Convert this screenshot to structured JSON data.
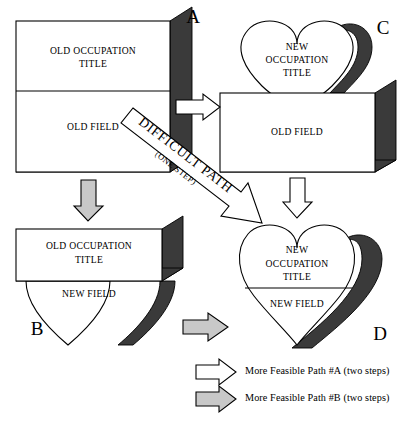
{
  "diagram": {
    "colors": {
      "shape_fill": "#ffffff",
      "shadow": "#3a3a3a",
      "arrow_feasible_a": "#ffffff",
      "arrow_feasible_b": "#c8c8c8",
      "stroke": "#000000"
    },
    "nodes": [
      {
        "id": "A",
        "corner_label": "A",
        "shape": "rectangle-3d",
        "upper_label": "OLD OCCUPATION TITLE",
        "upper_label_line1": "OLD OCCUPATION",
        "upper_label_line2": "TITLE",
        "lower_label": "OLD FIELD"
      },
      {
        "id": "C",
        "corner_label": "C",
        "shape": "heart-top-with-rectangle",
        "upper_label_line1": "NEW",
        "upper_label_line2": "OCCUPATION",
        "upper_label_line3": "TITLE",
        "lower_label": "OLD FIELD"
      },
      {
        "id": "B",
        "corner_label": "B",
        "shape": "rectangle-with-heart-bottom",
        "upper_label_line1": "OLD OCCUPATION",
        "upper_label_line2": "TITLE",
        "lower_label": "NEW FIELD"
      },
      {
        "id": "D",
        "corner_label": "D",
        "shape": "heart-3d",
        "upper_label_line1": "NEW",
        "upper_label_line2": "OCCUPATION",
        "upper_label_line3": "TITLE",
        "lower_label": "NEW FIELD"
      }
    ],
    "banner": {
      "text_line1": "DIFFICULT PATH",
      "text_line2": "(ONE STEP)"
    },
    "arrows": [
      {
        "id": "a-to-c",
        "style": "white",
        "direction": "right"
      },
      {
        "id": "a-to-b",
        "style": "gray",
        "direction": "down"
      },
      {
        "id": "c-to-d",
        "style": "white",
        "direction": "down"
      },
      {
        "id": "b-to-d",
        "style": "gray",
        "direction": "right"
      },
      {
        "id": "a-to-d-difficult",
        "style": "white",
        "direction": "diagonal"
      }
    ],
    "legend": {
      "items": [
        {
          "swatch": "white",
          "label": "More Feasible Path #A (two steps)"
        },
        {
          "swatch": "gray",
          "label": "More Feasible Path #B (two steps)"
        }
      ]
    }
  }
}
